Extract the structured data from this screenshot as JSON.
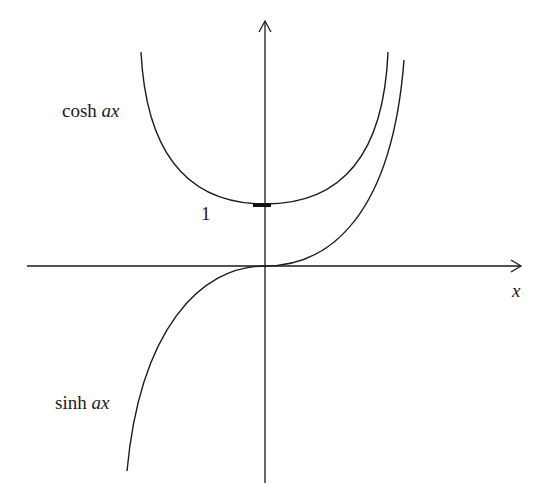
{
  "diagram": {
    "title": "",
    "curves": [
      {
        "name": "cosh",
        "label_fn": "cosh",
        "label_var": "ax"
      },
      {
        "name": "sinh",
        "label_fn": "sinh",
        "label_var": "ax"
      }
    ],
    "axes": {
      "x_label": "x",
      "y_tick_label": "1"
    },
    "colors": {
      "stroke": "#1a1a1a",
      "background": "#ffffff"
    }
  }
}
